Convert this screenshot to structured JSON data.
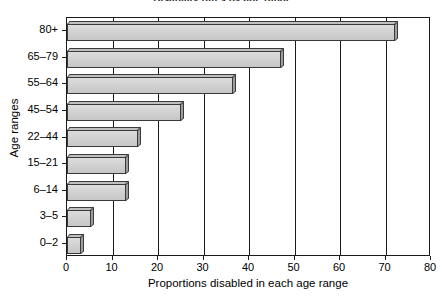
{
  "chart_data": {
    "type": "bar",
    "orientation": "horizontal",
    "title": "Disability rates by age range",
    "xlabel": "Proportions disabled in each age range",
    "ylabel": "Age ranges",
    "categories": [
      "0–2",
      "3–5",
      "6–14",
      "15–21",
      "22–44",
      "45–54",
      "55–64",
      "65–79",
      "80+"
    ],
    "values": [
      3,
      5.3,
      13,
      13,
      15.5,
      25,
      36.5,
      47,
      72
    ],
    "series": [
      {
        "name": "Proportions disabled",
        "values": [
          3,
          5.3,
          13,
          13,
          15.5,
          25,
          36.5,
          47,
          72
        ]
      }
    ],
    "xlim": [
      0,
      80
    ],
    "xticks": [
      0,
      10,
      20,
      30,
      40,
      50,
      60,
      70,
      80
    ],
    "xticklabels": [
      "0",
      "10",
      "20",
      "30",
      "40",
      "50",
      "60",
      "70",
      "80"
    ],
    "yticklabels_top_to_bottom": [
      "80+",
      "65–79",
      "55–64",
      "45–54",
      "22–44",
      "15–21",
      "6–14",
      "3–5",
      "0–2"
    ],
    "grid": "vertical",
    "legend": null,
    "bar_style": "3d-shaded-grey",
    "colors": {
      "bar_fill": "#d2d2d2",
      "bar_edge": "#3a3a3a",
      "bar_side": "#9e9e9e",
      "axis": "#1a1a1a",
      "background": "#ffffff",
      "text": "#000000"
    }
  }
}
